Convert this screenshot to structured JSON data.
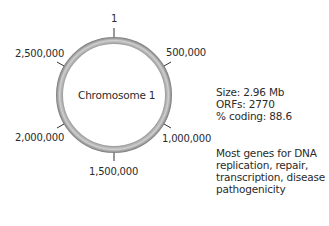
{
  "diagram": {
    "chromosome_label": "Chromosome 1",
    "ring": {
      "cx": 114,
      "cy": 95,
      "r": 54.5,
      "thickness": 7,
      "color_edge": "#7a7a7a",
      "color_mid": "#c4c4c4"
    },
    "ticks": [
      {
        "label": "1",
        "angle": 0
      },
      {
        "label": "500,000",
        "angle": 60
      },
      {
        "label": "1,000,000",
        "angle": 120
      },
      {
        "label": "1,500,000",
        "angle": 180
      },
      {
        "label": "2,000,000",
        "angle": 240
      },
      {
        "label": "2,500,000",
        "angle": 300
      }
    ]
  },
  "info": {
    "size": "Size: 2.96 Mb",
    "orfs": "ORFs: 2770",
    "coding": "% coding: 88.6",
    "description": [
      "Most genes for DNA",
      "replication, repair,",
      "transcription, disease",
      "pathogenicity"
    ]
  }
}
